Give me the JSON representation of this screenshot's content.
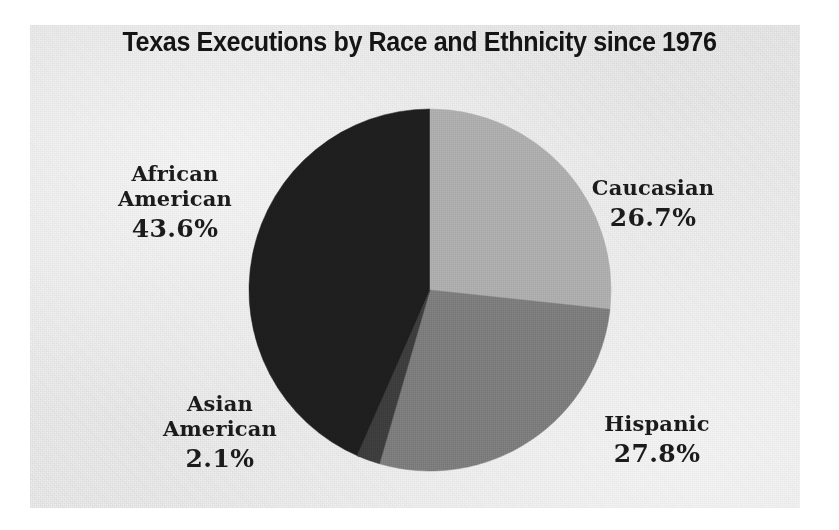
{
  "chart_data": {
    "type": "pie",
    "title": "Texas Executions by Race and Ethnicity since 1976",
    "xlabel": "",
    "ylabel": "",
    "unit": "%",
    "legend_position": "none",
    "labels_on_slices": true,
    "grid": false,
    "categories": [
      "African American",
      "Caucasian",
      "Hispanic",
      "Asian American"
    ],
    "values": [
      43.6,
      27.8,
      26.7,
      2.1
    ],
    "slices": [
      {
        "name": "african-american",
        "label_line1": "African",
        "label_line2": "American",
        "value": 43.6,
        "value_text": "43.6%",
        "color": "#1e1e1e",
        "start_angle_deg": 0,
        "sweep_deg": 156.96,
        "direction": "counterclockwise"
      },
      {
        "name": "caucasian",
        "label_line1": "Caucasian",
        "label_line2": "",
        "value": 26.7,
        "value_text": "26.7%",
        "color": "#adadad",
        "start_angle_deg": 0,
        "sweep_deg": 96.12,
        "direction": "clockwise"
      },
      {
        "name": "hispanic",
        "label_line1": "Hispanic",
        "label_line2": "",
        "value": 27.8,
        "value_text": "27.8%",
        "color": "#7c7c7c",
        "start_angle_deg": 96.12,
        "sweep_deg": 100.08,
        "direction": "clockwise"
      },
      {
        "name": "asian-american",
        "label_line1": "Asian",
        "label_line2": "American",
        "value": 2.1,
        "value_text": "2.1%",
        "color": "#3d3d3d",
        "start_angle_deg": 196.2,
        "sweep_deg": 7.56,
        "direction": "clockwise"
      }
    ]
  },
  "colors": {
    "background": "#ffffff",
    "plate": "#ececed",
    "title_text": "#141414",
    "label_text": "#1b1b1b",
    "african_american": "#1e1e1e",
    "asian_american": "#3d3d3d",
    "hispanic": "#7c7c7c",
    "caucasian": "#adadad"
  }
}
